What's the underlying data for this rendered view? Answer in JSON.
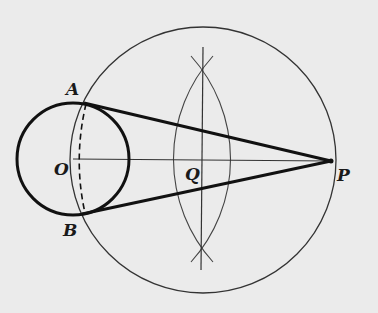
{
  "diagram": {
    "type": "geometry-construction",
    "colors": {
      "background": "#ebebeb",
      "ink": "#1a1a1a",
      "thin_line": "#333333"
    },
    "points": {
      "A": {
        "label": "A",
        "x": 86,
        "y": 103
      },
      "B": {
        "label": "B",
        "x": 84,
        "y": 214
      },
      "O": {
        "label": "O",
        "x": 73,
        "y": 159
      },
      "Q": {
        "label": "Q",
        "x": 202,
        "y": 160
      },
      "P": {
        "label": "P",
        "x": 331,
        "y": 161
      }
    },
    "shapes": [
      {
        "name": "small-circle",
        "center": "O",
        "radius": 56,
        "style": "thick"
      },
      {
        "name": "large-circle",
        "center": "Q",
        "radius": 133,
        "style": "thin"
      },
      {
        "name": "tangent-PA",
        "from": "P",
        "to": "A",
        "style": "thick"
      },
      {
        "name": "tangent-PB",
        "from": "P",
        "to": "B",
        "style": "thick"
      },
      {
        "name": "segment-OP",
        "from": "O",
        "to": "P",
        "style": "thin"
      },
      {
        "name": "chord-AB",
        "from": "A",
        "to": "B",
        "style": "dashed"
      },
      {
        "name": "perpendicular-bisector",
        "style": "thin"
      },
      {
        "name": "bisector-arcs",
        "style": "thin"
      }
    ]
  }
}
